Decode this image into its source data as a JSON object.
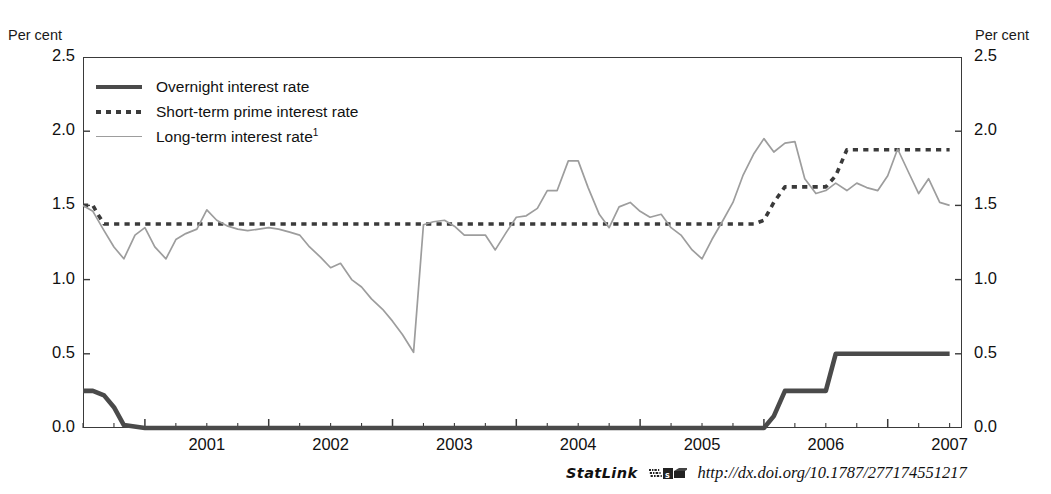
{
  "figure": {
    "title_clipped": "",
    "unit_left": "Per cent",
    "unit_right": "Per cent"
  },
  "legend": {
    "items": [
      {
        "label": "Overnight interest rate",
        "style": "solid-thick",
        "color": "#4a4a4a"
      },
      {
        "label": "Short-term prime interest rate",
        "style": "dotted",
        "color": "#3a3a3a"
      },
      {
        "label": "Long-term interest rate",
        "superscript": "1",
        "style": "solid-thin",
        "color": "#9d9d9d"
      }
    ]
  },
  "statlink": {
    "word": "StatLink",
    "glyph": "statlink-barcode-icon",
    "url": "http://dx.doi.org/10.1787/277174551217"
  },
  "chart_data": {
    "type": "line",
    "title": "",
    "xlabel": "",
    "ylabel": "Per cent",
    "ylim": [
      0.0,
      2.5
    ],
    "yticks": [
      0.0,
      0.5,
      1.0,
      1.5,
      2.0,
      2.5
    ],
    "ytick_labels": [
      "0.0",
      "0.5",
      "1.0",
      "1.5",
      "2.0",
      "2.5"
    ],
    "xlim": [
      2000.5,
      2007.6
    ],
    "xticks": [
      2001,
      2002,
      2003,
      2004,
      2005,
      2006,
      2007
    ],
    "xtick_labels": [
      "2001",
      "2002",
      "2003",
      "2004",
      "2005",
      "2006",
      "2007"
    ],
    "minor_xtick_step": 0.25,
    "grid": false,
    "legend_position": "upper-left-inside",
    "series": [
      {
        "name": "Overnight interest rate",
        "color": "#4a4a4a",
        "style": "solid",
        "width": 4.6,
        "x": [
          2000.5,
          2000.58,
          2000.67,
          2000.75,
          2000.83,
          2001.0,
          2002.0,
          2003.0,
          2004.0,
          2005.0,
          2005.83,
          2006.0,
          2006.08,
          2006.17,
          2006.42,
          2006.5,
          2006.58,
          2007.0,
          2007.5
        ],
        "y": [
          0.25,
          0.25,
          0.22,
          0.14,
          0.02,
          0.0,
          0.0,
          0.0,
          0.0,
          0.0,
          0.0,
          0.0,
          0.08,
          0.25,
          0.25,
          0.25,
          0.5,
          0.5,
          0.5
        ]
      },
      {
        "name": "Short-term prime interest rate",
        "color": "#3a3a3a",
        "style": "dotted",
        "width": 3.6,
        "x": [
          2000.5,
          2000.58,
          2000.62,
          2000.67,
          2000.75,
          2001.0,
          2002.0,
          2003.0,
          2004.0,
          2005.0,
          2005.75,
          2005.92,
          2006.0,
          2006.08,
          2006.17,
          2006.25,
          2006.5,
          2006.58,
          2006.67,
          2006.75,
          2007.0,
          2007.5
        ],
        "y": [
          1.5,
          1.5,
          1.44,
          1.375,
          1.375,
          1.375,
          1.375,
          1.375,
          1.375,
          1.375,
          1.375,
          1.375,
          1.4,
          1.52,
          1.625,
          1.625,
          1.625,
          1.7,
          1.875,
          1.875,
          1.875,
          1.875
        ]
      },
      {
        "name": "Long-term interest rate",
        "color": "#9d9d9d",
        "style": "solid",
        "width": 1.7,
        "x": [
          2000.5,
          2000.58,
          2000.67,
          2000.75,
          2000.83,
          2000.92,
          2001.0,
          2001.08,
          2001.17,
          2001.25,
          2001.33,
          2001.42,
          2001.5,
          2001.58,
          2001.67,
          2001.75,
          2001.83,
          2001.92,
          2002.0,
          2002.08,
          2002.17,
          2002.25,
          2002.33,
          2002.42,
          2002.5,
          2002.58,
          2002.67,
          2002.75,
          2002.83,
          2002.92,
          2003.0,
          2003.08,
          2003.17,
          2003.25,
          2003.33,
          2003.42,
          2003.5,
          2003.58,
          2003.67,
          2003.75,
          2003.83,
          2003.92,
          2004.0,
          2004.08,
          2004.17,
          2004.25,
          2004.33,
          2004.42,
          2004.5,
          2004.58,
          2004.67,
          2004.75,
          2004.83,
          2004.92,
          2005.0,
          2005.08,
          2005.17,
          2005.25,
          2005.33,
          2005.42,
          2005.5,
          2005.58,
          2005.67,
          2005.75,
          2005.83,
          2005.92,
          2006.0,
          2006.08,
          2006.17,
          2006.25,
          2006.33,
          2006.42,
          2006.5,
          2006.58,
          2006.67,
          2006.75,
          2006.83,
          2006.92,
          2007.0,
          2007.08,
          2007.17,
          2007.25,
          2007.33,
          2007.42,
          2007.5
        ],
        "y": [
          1.5,
          1.46,
          1.33,
          1.22,
          1.14,
          1.3,
          1.35,
          1.22,
          1.14,
          1.27,
          1.31,
          1.34,
          1.47,
          1.4,
          1.36,
          1.34,
          1.33,
          1.34,
          1.35,
          1.34,
          1.32,
          1.3,
          1.22,
          1.15,
          1.08,
          1.11,
          1.0,
          0.95,
          0.87,
          0.8,
          0.72,
          0.63,
          0.51,
          1.37,
          1.39,
          1.4,
          1.36,
          1.3,
          1.3,
          1.3,
          1.2,
          1.32,
          1.42,
          1.43,
          1.48,
          1.6,
          1.6,
          1.8,
          1.8,
          1.62,
          1.44,
          1.35,
          1.49,
          1.52,
          1.46,
          1.42,
          1.44,
          1.35,
          1.3,
          1.2,
          1.14,
          1.27,
          1.4,
          1.52,
          1.7,
          1.85,
          1.95,
          1.86,
          1.92,
          1.93,
          1.68,
          1.58,
          1.6,
          1.65,
          1.6,
          1.65,
          1.62,
          1.6,
          1.7,
          1.88,
          1.72,
          1.58,
          1.68,
          1.52,
          1.5
        ]
      }
    ]
  }
}
